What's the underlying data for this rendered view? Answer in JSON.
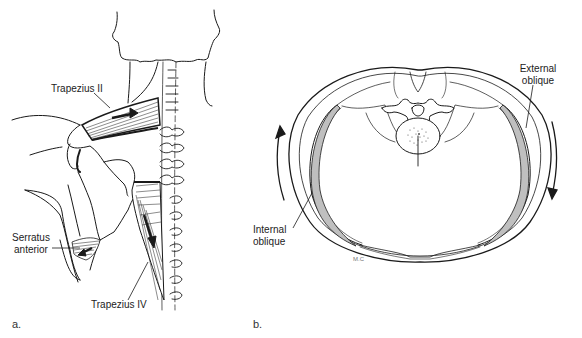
{
  "figure": {
    "panels": [
      {
        "letter": "a.",
        "title": "Posterior view of shoulder and spine",
        "labels": {
          "trapezius_ii": "Trapezius II",
          "serratus_line1": "Serratus",
          "serratus_line2": "anterior",
          "trapezius_iv": "Trapezius IV"
        }
      },
      {
        "letter": "b.",
        "title": "Transverse section of trunk",
        "labels": {
          "external_line1": "External",
          "external_line2": "oblique",
          "internal_line1": "Internal",
          "internal_line2": "oblique",
          "signature": "M.C"
        }
      }
    ]
  },
  "colors": {
    "ink": "#1a1a1a",
    "muscle_fill": "#bfbfbf",
    "background": "#ffffff"
  }
}
